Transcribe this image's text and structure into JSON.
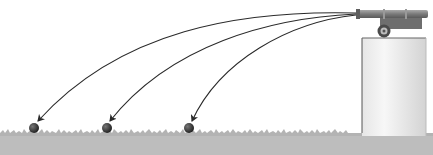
{
  "diagram": {
    "title": "",
    "colors": {
      "background": "#ffffff",
      "ground": "#b9b9b9",
      "cliff_light": "#f4f4f4",
      "cliff_dark": "#cfcfcf",
      "cannon": "#7d7d7d",
      "trajectory": "#2a2a2a",
      "ball": "#333333"
    },
    "elements": {
      "cannon": {
        "icon": "cannon-icon",
        "x": 360,
        "y": 10
      },
      "cliff": {
        "x": 362,
        "y": 38,
        "width": 64,
        "height": 98
      },
      "ground_y": 133,
      "trajectories": [
        {
          "label": "fastest",
          "land_x": 36
        },
        {
          "label": "medium",
          "land_x": 108
        },
        {
          "label": "slowest",
          "land_x": 190
        }
      ]
    }
  }
}
